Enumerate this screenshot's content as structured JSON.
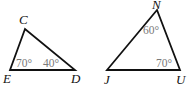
{
  "diagram": {
    "type": "geometry-triangles",
    "triangles": [
      {
        "name": "triangle-CED",
        "vertices": [
          {
            "label": "C",
            "x": 25,
            "y": 29,
            "label_x": 19,
            "label_y": 24
          },
          {
            "label": "E",
            "x": 10,
            "y": 70,
            "label_x": 3,
            "label_y": 83
          },
          {
            "label": "D",
            "x": 75,
            "y": 70,
            "label_x": 71,
            "label_y": 83
          }
        ],
        "angles": [
          {
            "vertex": "E",
            "value": "70°",
            "x": 16,
            "y": 67
          },
          {
            "vertex": "D",
            "value": "40°",
            "x": 43,
            "y": 67
          }
        ]
      },
      {
        "name": "triangle-NJU",
        "vertices": [
          {
            "label": "N",
            "x": 157,
            "y": 10,
            "label_x": 152,
            "label_y": 9
          },
          {
            "label": "J",
            "x": 107,
            "y": 70,
            "label_x": 104,
            "label_y": 84
          },
          {
            "label": "U",
            "x": 180,
            "y": 70,
            "label_x": 176,
            "label_y": 84
          }
        ],
        "angles": [
          {
            "vertex": "N",
            "value": "60°",
            "x": 143,
            "y": 34
          },
          {
            "vertex": "U",
            "value": "70°",
            "x": 156,
            "y": 67
          }
        ]
      }
    ]
  },
  "colors": {
    "stroke": "#111111",
    "vertex_label": "#111111",
    "angle_label": "#7a7a7a",
    "background": "#ffffff"
  }
}
